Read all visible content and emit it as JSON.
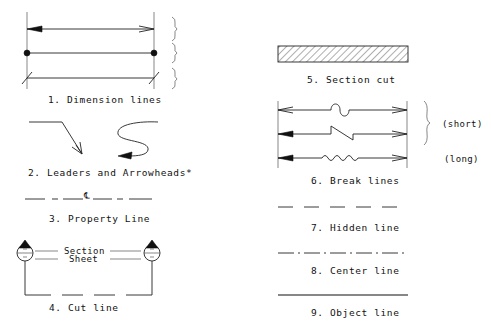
{
  "diagram": {
    "type": "drafting-line-conventions",
    "items": [
      {
        "id": 1,
        "label": "1. Dimension lines"
      },
      {
        "id": 2,
        "label": "2. Leaders and Arrowheads*"
      },
      {
        "id": 3,
        "label": "3. Property Line",
        "symbol": "℄"
      },
      {
        "id": 4,
        "label": "4. Cut line",
        "inner_labels": [
          "Section",
          "Sheet"
        ]
      },
      {
        "id": 5,
        "label": "5. Section cut"
      },
      {
        "id": 6,
        "label": "6. Break lines",
        "variants": [
          "(short)",
          "(long)"
        ]
      },
      {
        "id": 7,
        "label": "7. Hidden line"
      },
      {
        "id": 8,
        "label": "8. Center line"
      },
      {
        "id": 9,
        "label": "9. Object line"
      }
    ],
    "colors": {
      "ink": "#111111",
      "background": "#ffffff"
    }
  }
}
